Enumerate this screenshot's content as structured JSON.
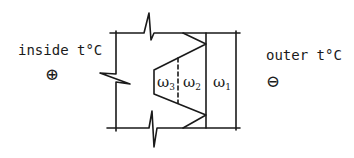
{
  "diagram": {
    "inside_label": "inside t°C",
    "inside_sign": "⊕",
    "outer_label": "outer t°C",
    "outer_sign": "⊖",
    "layers": [
      {
        "symbol": "ω",
        "subscript": "3"
      },
      {
        "symbol": "ω",
        "subscript": "2"
      },
      {
        "symbol": "ω",
        "subscript": "1"
      }
    ],
    "colors": {
      "ink": "#1a1a1a",
      "background": "#ffffff"
    }
  }
}
